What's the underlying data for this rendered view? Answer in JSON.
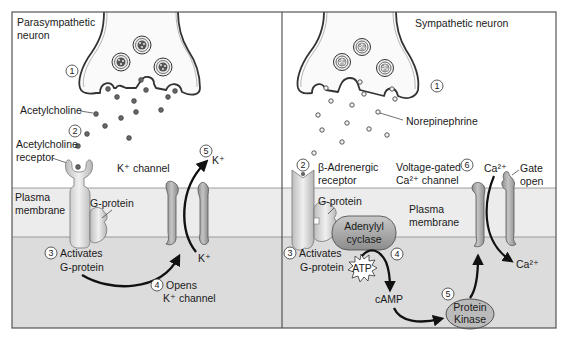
{
  "panels": [
    {
      "title_line1": "Parasympathetic",
      "title_line2": "neuron",
      "step1": "1",
      "neurotransmitter": "Acetylcholine",
      "step2": "2",
      "receptor_line1": "Acetylcholine",
      "receptor_line2": "receptor",
      "channel_label": "K⁺ channel",
      "step5": "5",
      "ion_out": "K⁺",
      "membrane_line1": "Plasma",
      "membrane_line2": "membrane",
      "gprotein": "G-protein",
      "step3": "3",
      "activates_line1": "Activates",
      "activates_line2": "G-protein",
      "ion_in": "K⁺",
      "step4": "4",
      "opens_line1": "Opens",
      "opens_line2": "K⁺ channel"
    },
    {
      "title": "Sympathetic neuron",
      "step1": "1",
      "neurotransmitter": "Norepinephrine",
      "step2": "2",
      "receptor_line1": "β-Adrenergic",
      "receptor_line2": "receptor",
      "channel_line1": "Voltage-gated",
      "channel_line2": "Ca²⁺ channel",
      "step6": "6",
      "ion_top": "Ca²⁺",
      "gate_line1": "Gate",
      "gate_line2": "open",
      "gprotein": "G-protein",
      "membrane_line1": "Plasma",
      "membrane_line2": "membrane",
      "enzyme_line1": "Adenylyl",
      "enzyme_line2": "cyclase",
      "step3": "3",
      "activates_line1": "Activates",
      "activates_line2": "G-protein",
      "atp": "ATP",
      "step4": "4",
      "camp": "cAMP",
      "step5": "5",
      "kinase_line1": "Protein",
      "kinase_line2": "Kinase",
      "ion_bottom": "Ca²⁺"
    }
  ],
  "colors": {
    "frame": "#555555",
    "membrane": "#ececec",
    "cytoplasm": "#dcdcdc",
    "protein": "#a8a8a8",
    "protein_light": "#e2e2e2",
    "ink": "#1a1a1a"
  }
}
